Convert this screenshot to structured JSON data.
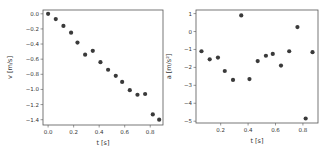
{
  "chart_data": [
    {
      "type": "scatter",
      "title": "",
      "xlabel": "t [s]",
      "ylabel": "v [m/s]",
      "xlim": [
        -0.04,
        0.9
      ],
      "ylim": [
        -1.47,
        0.05
      ],
      "xticks": [
        0.0,
        0.2,
        0.4,
        0.6,
        0.8
      ],
      "xtick_labels": [
        "0.0",
        "0.2",
        "0.4",
        "0.6",
        "0.8"
      ],
      "yticks": [
        0.0,
        -0.2,
        -0.4,
        -0.6,
        -0.8,
        -1.0,
        -1.2,
        -1.4
      ],
      "ytick_labels": [
        "0.0",
        "−0.2",
        "−0.4",
        "−0.6",
        "−0.8",
        "−1.0",
        "−1.2",
        "−1.4"
      ],
      "grid": false,
      "legend": null,
      "marker_color": "#3a3a3a",
      "x": [
        0.0,
        0.06,
        0.12,
        0.18,
        0.23,
        0.29,
        0.35,
        0.41,
        0.47,
        0.53,
        0.58,
        0.64,
        0.7,
        0.76,
        0.82,
        0.87
      ],
      "y": [
        0.0,
        -0.07,
        -0.16,
        -0.25,
        -0.38,
        -0.54,
        -0.49,
        -0.64,
        -0.74,
        -0.82,
        -0.9,
        -1.01,
        -1.07,
        -1.06,
        -1.33,
        -1.4
      ]
    },
    {
      "type": "scatter",
      "title": "",
      "xlabel": "t [s]",
      "ylabel": "a [m/s²]",
      "xlim": [
        0.02,
        0.91
      ],
      "ylim": [
        -5.1,
        1.2
      ],
      "xticks": [
        0.2,
        0.4,
        0.6,
        0.8
      ],
      "xtick_labels": [
        "0.2",
        "0.4",
        "0.6",
        "0.8"
      ],
      "yticks": [
        1,
        0,
        -1,
        -2,
        -3,
        -4,
        -5
      ],
      "ytick_labels": [
        "1",
        "0",
        "−1",
        "−2",
        "−3",
        "−4",
        "−5"
      ],
      "grid": false,
      "legend": null,
      "marker_color": "#3a3a3a",
      "x": [
        0.06,
        0.12,
        0.18,
        0.23,
        0.29,
        0.35,
        0.41,
        0.47,
        0.53,
        0.58,
        0.64,
        0.7,
        0.76,
        0.82,
        0.87
      ],
      "y": [
        -1.1,
        -1.55,
        -1.45,
        -2.2,
        -2.7,
        0.9,
        -2.65,
        -1.65,
        -1.35,
        -1.25,
        -1.9,
        -1.1,
        0.25,
        -4.85,
        -1.15
      ]
    }
  ]
}
